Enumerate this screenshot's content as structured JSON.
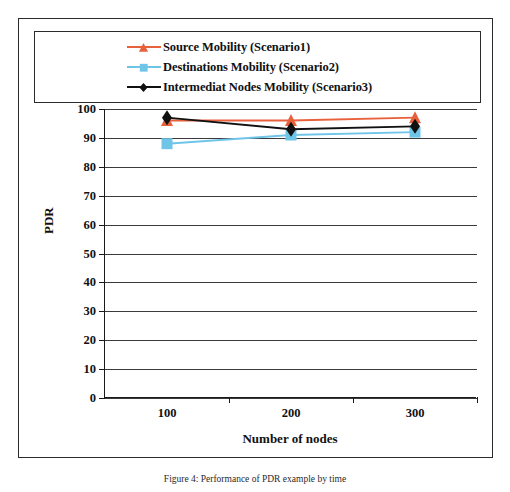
{
  "figure": {
    "caption": "Figure 4: Performance of PDR example by time"
  },
  "chart_data": {
    "type": "line",
    "title": "",
    "xlabel": "Number of nodes",
    "ylabel": "PDR",
    "categories": [
      "100",
      "200",
      "300"
    ],
    "x": [
      100,
      200,
      300
    ],
    "ylim": [
      0,
      100
    ],
    "ytick_step": 10,
    "yticks": [
      "100",
      "90",
      "80",
      "70",
      "60",
      "50",
      "40",
      "30",
      "20",
      "10",
      "0"
    ],
    "grid": true,
    "legend_position": "top",
    "series": [
      {
        "name": "Source Mobility (Scenario1)",
        "label": "Source Mobility (Scenario1)",
        "color": "#E8603C",
        "marker": "triangle",
        "values": [
          96,
          96,
          97
        ]
      },
      {
        "name": "Destinations  Mobility (Scenario2)",
        "label": "Destinations  Mobility (Scenario2)",
        "color": "#6FC5E8",
        "marker": "square",
        "values": [
          88,
          91,
          92
        ]
      },
      {
        "name": "Intermediat Nodes Mobility (Scenario3)",
        "label": "Intermediat Nodes Mobility (Scenario3)",
        "color": "#111111",
        "marker": "diamond",
        "values": [
          97,
          93,
          94
        ]
      }
    ]
  }
}
